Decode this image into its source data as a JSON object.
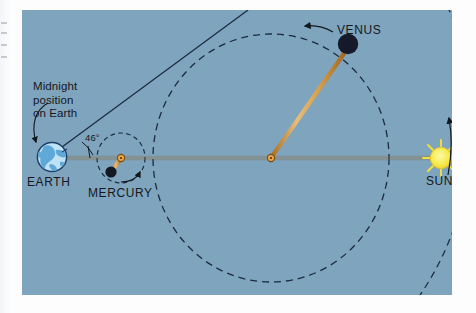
{
  "figure": {
    "kind": "astronomy-orbit-diagram",
    "background_color": "#7fa4bd",
    "panel": {
      "x": 22,
      "y": 10,
      "width": 430,
      "height": 285
    }
  },
  "labels": {
    "midnight_note_line1": "Midnight",
    "midnight_note_line2": "position",
    "midnight_note_line3": "on Earth",
    "earth": "EARTH",
    "mercury": "MERCURY",
    "venus": "VENUS",
    "sun": "SUN",
    "elongation_angle": "46°"
  },
  "bodies": [
    {
      "name": "earth",
      "label": "EARTH",
      "x": 52,
      "y": 157,
      "radius": 15,
      "color": "#bfe3f4",
      "outline": "#1d3f6b"
    },
    {
      "name": "mercury",
      "label": "MERCURY",
      "x": 112,
      "y": 172,
      "radius": 5.5,
      "color": "#141a24",
      "outline": "#141a24"
    },
    {
      "name": "venus",
      "label": "VENUS",
      "x": 348,
      "y": 44,
      "radius": 10,
      "color": "#15192a",
      "outline": "#15192a"
    },
    {
      "name": "sun",
      "label": "SUN",
      "x": 441,
      "y": 158,
      "radius": 11,
      "color": "#f7ec52",
      "outline": "#e8b52a"
    }
  ],
  "orbit_centers": [
    {
      "name": "mercury-orbit-center",
      "x": 121,
      "y": 158
    },
    {
      "name": "venus-orbit-center",
      "x": 271,
      "y": 158
    }
  ],
  "orbits": [
    {
      "name": "mercury-orbit",
      "cx": 121,
      "cy": 158,
      "rx": 24,
      "ry": 25,
      "style": "dashed",
      "color": "#1c2b3f"
    },
    {
      "name": "venus-orbit",
      "cx": 271,
      "cy": 158,
      "rx": 118,
      "ry": 124,
      "style": "dashed",
      "color": "#1c2b3f"
    },
    {
      "name": "earth-orbit",
      "style": "dashed-arc",
      "color": "#1c2b3f"
    }
  ],
  "sight_lines": [
    {
      "name": "earth-sun-line",
      "from": "earth",
      "to": "sun",
      "color": "#c98a32"
    },
    {
      "name": "venus-center-line",
      "from": "venus",
      "to": "venus-orbit-center",
      "color": "#c98a32"
    },
    {
      "name": "mercury-center-line",
      "from": "mercury",
      "to": "mercury-orbit-center",
      "color": "#c98a32"
    },
    {
      "name": "earth-tangent-line",
      "from": "earth",
      "to": "upper-right",
      "color": "#1c2b3f"
    }
  ],
  "arrows": [
    {
      "name": "midnight-pointer-arrow",
      "points_to": "earth-surface-midnight-point"
    },
    {
      "name": "venus-direction-arrow",
      "points_to": "counterclockwise-along-venus-orbit"
    },
    {
      "name": "mercury-direction-arrow",
      "points_to": "counterclockwise-along-mercury-orbit"
    },
    {
      "name": "earth-direction-arrow",
      "points_to": "counterclockwise-along-earth-orbit"
    }
  ],
  "colors": {
    "background": "#7fa4bd",
    "orbit_stroke": "#1c2b3f",
    "ray_orange": "#c98a32",
    "ray_orange_light": "#e8b871",
    "sun_yellow": "#f7ec52",
    "earth_blue": "#bfe3f4",
    "earth_land": "#5fa8d8",
    "planet_dark": "#15192a",
    "text": "#15181c"
  }
}
